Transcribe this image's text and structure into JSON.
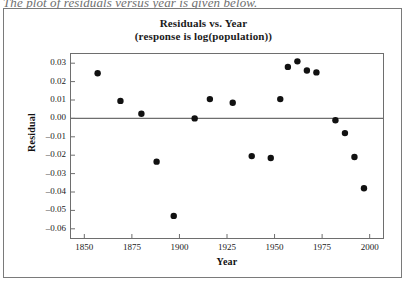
{
  "scan": {
    "cut_off_line": "The plot of residuals versus year is given below."
  },
  "chart_data": {
    "type": "scatter",
    "title": "Residuals vs. Year",
    "subtitle": "(response is log(population))",
    "xlabel": "Year",
    "ylabel": "Residual",
    "xlim": [
      1843,
      2007
    ],
    "ylim": [
      -0.065,
      0.035
    ],
    "xticks": [
      1850,
      1875,
      1900,
      1925,
      1950,
      1975,
      2000
    ],
    "xtick_labels": [
      "1850",
      "1875",
      "1900",
      "1925",
      "1950",
      "1975",
      "2000"
    ],
    "yticks": [
      0.03,
      0.02,
      0.01,
      0.0,
      -0.01,
      -0.02,
      -0.03,
      -0.04,
      -0.05,
      -0.06
    ],
    "ytick_labels": [
      "0.03",
      "0.02",
      "0.01",
      "0.00",
      "-0.01",
      "-0.02",
      "-0.03",
      "-0.04",
      "-0.05",
      "-0.06"
    ],
    "grid": false,
    "legend": "none",
    "reference_line_y": 0.0,
    "marker": "filled-circle",
    "marker_color": "#111111",
    "marker_size": 3.2,
    "x": [
      1857,
      1869,
      1880,
      1888,
      1897,
      1908,
      1916,
      1928,
      1938,
      1948,
      1953,
      1957,
      1962,
      1967,
      1972,
      1982,
      1987,
      1992,
      1997
    ],
    "y": [
      0.0245,
      0.0095,
      0.0025,
      -0.0235,
      -0.053,
      0.0,
      0.0105,
      0.0085,
      -0.0205,
      -0.0215,
      0.0105,
      0.028,
      0.031,
      0.026,
      0.025,
      -0.001,
      -0.008,
      -0.021,
      -0.038
    ],
    "point_count": 19
  }
}
